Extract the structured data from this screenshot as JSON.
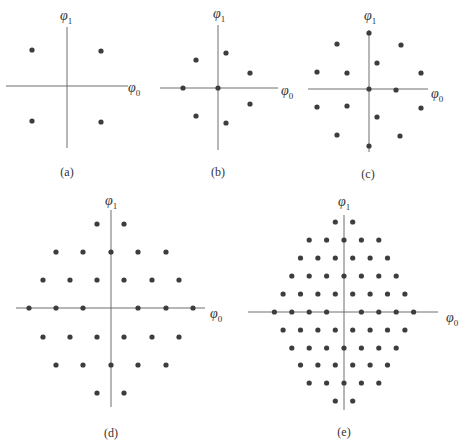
{
  "figure": {
    "axis_labels": {
      "horizontal": "φ",
      "horizontal_sub": "0",
      "vertical": "φ",
      "vertical_sub": "1"
    },
    "colors": {
      "dot": "#3d3d3d",
      "axis": "#6e6e6e",
      "text": "#333333"
    },
    "panels": [
      {
        "id": "a",
        "caption": "(a)",
        "origin": [
          67,
          86
        ],
        "h_axis": [
          6,
          128
        ],
        "v_axis": [
          27,
          148
        ],
        "phi0_label_pos": [
          128,
          92
        ],
        "phi1_label_pos": [
          60,
          20
        ],
        "caption_pos": [
          67,
          176
        ],
        "points": [
          [
            32,
            50
          ],
          [
            101,
            51
          ],
          [
            32,
            121
          ],
          [
            101,
            122
          ]
        ]
      },
      {
        "id": "b",
        "caption": "(b)",
        "origin": [
          218,
          88
        ],
        "h_axis": [
          160,
          278
        ],
        "v_axis": [
          25,
          150
        ],
        "phi0_label_pos": [
          281,
          95
        ],
        "phi1_label_pos": [
          213,
          18
        ],
        "caption_pos": [
          218,
          176
        ],
        "points": [
          [
            196,
            60
          ],
          [
            226,
            53
          ],
          [
            250,
            73
          ],
          [
            183,
            88
          ],
          [
            218,
            88
          ],
          [
            250,
            104
          ],
          [
            196,
            116
          ],
          [
            226,
            123
          ]
        ]
      },
      {
        "id": "c",
        "caption": "(c)",
        "origin": [
          369,
          89
        ],
        "h_axis": [
          308,
          428
        ],
        "v_axis": [
          30,
          152
        ],
        "phi0_label_pos": [
          431,
          98
        ],
        "phi1_label_pos": [
          364,
          20
        ],
        "caption_pos": [
          368,
          178
        ],
        "points": [
          [
            369,
            33
          ],
          [
            337,
            44
          ],
          [
            401,
            45
          ],
          [
            377,
            63
          ],
          [
            317,
            72
          ],
          [
            347,
            73
          ],
          [
            421,
            73
          ],
          [
            369,
            89
          ],
          [
            396,
            90
          ],
          [
            317,
            107
          ],
          [
            347,
            106
          ],
          [
            421,
            108
          ],
          [
            377,
            117
          ],
          [
            337,
            135
          ],
          [
            400,
            136
          ],
          [
            369,
            146
          ]
        ]
      },
      {
        "id": "d",
        "caption": "(d)",
        "origin": [
          111,
          308
        ],
        "h_axis": [
          16,
          205
        ],
        "v_axis": [
          210,
          407
        ],
        "phi0_label_pos": [
          210,
          318
        ],
        "phi1_label_pos": [
          105,
          205
        ],
        "caption_pos": [
          111,
          437
        ],
        "points": [
          [
            97,
            224
          ],
          [
            124,
            224
          ],
          [
            56,
            252
          ],
          [
            83,
            252
          ],
          [
            111,
            252
          ],
          [
            138,
            252
          ],
          [
            166,
            252
          ],
          [
            43,
            280
          ],
          [
            70,
            280
          ],
          [
            97,
            280
          ],
          [
            124,
            280
          ],
          [
            152,
            280
          ],
          [
            179,
            280
          ],
          [
            29,
            308
          ],
          [
            56,
            308
          ],
          [
            83,
            308
          ],
          [
            138,
            308
          ],
          [
            166,
            308
          ],
          [
            193,
            308
          ],
          [
            43,
            337
          ],
          [
            70,
            337
          ],
          [
            97,
            337
          ],
          [
            124,
            337
          ],
          [
            152,
            337
          ],
          [
            179,
            337
          ],
          [
            56,
            365
          ],
          [
            83,
            365
          ],
          [
            111,
            365
          ],
          [
            138,
            365
          ],
          [
            166,
            365
          ],
          [
            97,
            393
          ],
          [
            124,
            393
          ]
        ]
      },
      {
        "id": "e",
        "caption": "(e)",
        "origin": [
          344,
          312
        ],
        "h_axis": [
          248,
          438
        ],
        "v_axis": [
          215,
          410
        ],
        "phi0_label_pos": [
          446,
          322
        ],
        "phi1_label_pos": [
          338,
          206
        ],
        "caption_pos": [
          344,
          436
        ],
        "grid_step": 8.7,
        "rows": [
          {
            "y": 222,
            "k": [
              -1,
              1
            ]
          },
          {
            "y": 240,
            "k": [
              -4,
              -2,
              0,
              2,
              4
            ]
          },
          {
            "y": 258,
            "k": [
              -5,
              -3,
              -1,
              1,
              3,
              5
            ]
          },
          {
            "y": 276,
            "k": [
              -6,
              -4,
              -2,
              0,
              2,
              4,
              6
            ]
          },
          {
            "y": 294,
            "k": [
              -7,
              -5,
              -3,
              -1,
              1,
              3,
              5,
              7
            ]
          },
          {
            "y": 312,
            "k": [
              -8,
              -6,
              -4,
              -2,
              2,
              4,
              6,
              8
            ]
          },
          {
            "y": 330,
            "k": [
              -7,
              -5,
              -3,
              -1,
              1,
              3,
              5,
              7
            ]
          },
          {
            "y": 348,
            "k": [
              -6,
              -4,
              -2,
              0,
              2,
              4,
              6
            ]
          },
          {
            "y": 365,
            "k": [
              -5,
              -3,
              -1,
              1,
              3,
              5
            ]
          },
          {
            "y": 383,
            "k": [
              -4,
              -2,
              0,
              2,
              4
            ]
          },
          {
            "y": 401,
            "k": [
              -1,
              1
            ]
          }
        ]
      }
    ]
  }
}
